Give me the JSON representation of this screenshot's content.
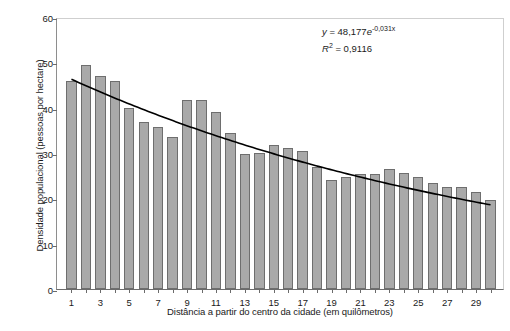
{
  "chart_data": {
    "type": "bar",
    "title": "",
    "xlabel": "Distância a partir do centro da cidade (em quilômetros)",
    "ylabel": "Densidade populacional (pessoas por hectare)",
    "xlim": [
      0,
      31
    ],
    "ylim": [
      0,
      60
    ],
    "yticks": [
      0,
      10,
      20,
      30,
      40,
      50,
      60
    ],
    "xticks": [
      1,
      3,
      5,
      7,
      9,
      11,
      13,
      15,
      17,
      19,
      21,
      23,
      25,
      27,
      29
    ],
    "grid": false,
    "legend": "none",
    "bar_color": "#a9a9a9",
    "bar_edge_color": "#6e6e6e",
    "trend_color": "#000000",
    "categories": [
      1,
      2,
      3,
      4,
      5,
      6,
      7,
      8,
      9,
      10,
      11,
      12,
      13,
      14,
      15,
      16,
      17,
      18,
      19,
      20,
      21,
      22,
      23,
      24,
      25,
      26,
      27,
      28,
      29,
      30
    ],
    "values": [
      45.9,
      49.4,
      47.0,
      45.8,
      40.0,
      36.9,
      35.8,
      33.5,
      41.7,
      41.7,
      39.0,
      34.4,
      29.8,
      30.1,
      31.8,
      31.2,
      30.5,
      27.0,
      24.0,
      24.7,
      25.3,
      25.4,
      26.5,
      25.5,
      24.6,
      23.3,
      22.5,
      22.5,
      21.5,
      19.7
    ],
    "annotations": {
      "equation_y": "y",
      "equation_eq": " = 48,177",
      "equation_e": "e",
      "equation_exp": "-0,031x",
      "r_squared_label": "R",
      "r_squared_sup": "2",
      "r_squared_value": " = 0,9116"
    },
    "trendline": {
      "type": "exponential",
      "a": 48.177,
      "b": -0.031,
      "r2": 0.9116
    }
  }
}
